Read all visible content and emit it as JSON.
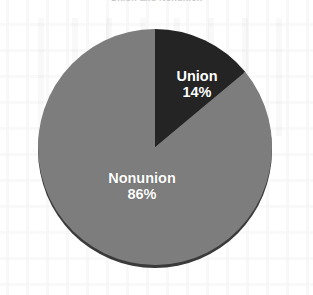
{
  "figure": {
    "width": 313,
    "height": 295,
    "background_color": "#ffffff",
    "top_caption": "Union and Nonunion"
  },
  "chart_data": {
    "type": "pie",
    "title": "",
    "subtitle": "",
    "xlabel": "",
    "ylabel": "",
    "categories": [
      "Union",
      "Nonunion"
    ],
    "values": [
      14,
      86
    ],
    "value_unit": "percent",
    "data_labels": [
      "14%",
      "86%"
    ],
    "slices": [
      {
        "label": "Union",
        "value": 14,
        "value_label": "14%",
        "color": "#242424",
        "start_angle_deg": 0,
        "end_angle_deg": 50.4,
        "label_color": "#ffffff"
      },
      {
        "label": "Nonunion",
        "value": 86,
        "value_label": "86%",
        "color": "#7d7d7d",
        "start_angle_deg": 50.4,
        "end_angle_deg": 360,
        "label_color": "#ffffff"
      }
    ],
    "total": 100,
    "start_angle_deg": 0,
    "direction": "clockwise",
    "legend": false,
    "legend_position": "none",
    "grid": false,
    "labels_inside_slices": true,
    "style": {
      "rim_color": "#3a3a3a",
      "rim_shadow": true,
      "three_d": true,
      "geometry": {
        "center_x": 155,
        "center_y": 147,
        "radius_x": 117,
        "radius_y": 118
      }
    }
  }
}
